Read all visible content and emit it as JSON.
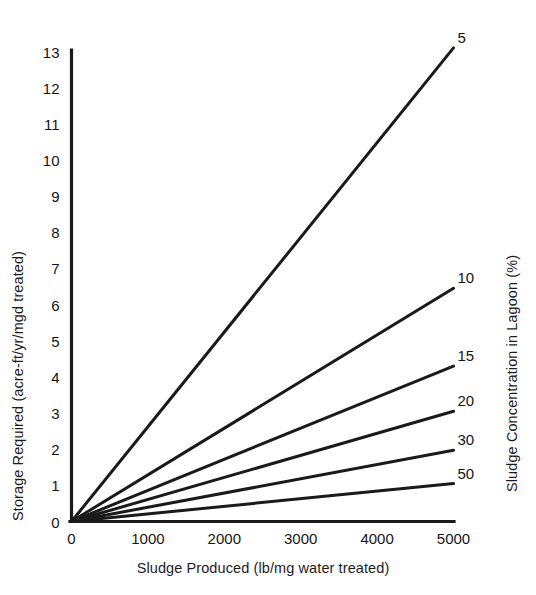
{
  "chart_data": {
    "type": "line",
    "title": "",
    "xlabel": "Sludge Produced (lb/mg water treated)",
    "ylabel": "Storage Required (acre-ft/yr/mgd treated)",
    "y2label": "Sludge Concentration in Lagoon (%)",
    "xlim": [
      0,
      5000
    ],
    "ylim": [
      0,
      13
    ],
    "xticks": [
      "0",
      "1000",
      "2000",
      "3000",
      "4000",
      "5000"
    ],
    "xtick_values": [
      0,
      1000,
      2000,
      3000,
      4000,
      5000
    ],
    "yticks": [
      "0",
      "1",
      "2",
      "3",
      "4",
      "5",
      "6",
      "7",
      "8",
      "9",
      "10",
      "11",
      "12",
      "13"
    ],
    "ytick_values": [
      0,
      1,
      2,
      3,
      4,
      5,
      6,
      7,
      8,
      9,
      10,
      11,
      12,
      13
    ],
    "grid": false,
    "legend_position": "right-inline-end-labels",
    "line_color": "#1a1a1a",
    "series": [
      {
        "name": "5",
        "label": "5",
        "x": [
          0,
          5000
        ],
        "values": [
          0,
          13.1
        ]
      },
      {
        "name": "10",
        "label": "10",
        "x": [
          0,
          5000
        ],
        "values": [
          0,
          6.45
        ]
      },
      {
        "name": "15",
        "label": "15",
        "x": [
          0,
          5000
        ],
        "values": [
          0,
          4.3
        ]
      },
      {
        "name": "20",
        "label": "20",
        "x": [
          0,
          5000
        ],
        "values": [
          0,
          3.05
        ]
      },
      {
        "name": "30",
        "label": "30",
        "x": [
          0,
          5000
        ],
        "values": [
          0,
          1.97
        ]
      },
      {
        "name": "50",
        "label": "50",
        "x": [
          0,
          5000
        ],
        "values": [
          0,
          1.05
        ]
      }
    ]
  }
}
